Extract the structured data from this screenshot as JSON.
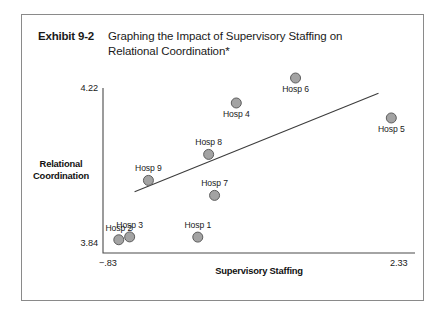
{
  "exhibit": {
    "number": "Exhibit 9-2",
    "title": "Graphing the Impact of Supervisory Staffing on Relational Coordination*"
  },
  "chart_data": {
    "type": "scatter",
    "title": "Graphing the Impact of Supervisory Staffing on Relational Coordination*",
    "xlabel": "Supervisory Staffing",
    "ylabel": "Relational Coordination",
    "xlim": [
      -0.83,
      2.33
    ],
    "ylim": [
      3.84,
      4.22
    ],
    "xticks": [
      "−.83",
      "2.33"
    ],
    "yticks": [
      "4.22",
      "3.84"
    ],
    "grid": false,
    "legend": false,
    "points": [
      {
        "label": "Hosp 1",
        "x": 0.13,
        "y": 3.8766,
        "label_pos": "above"
      },
      {
        "label": "Hosp 2",
        "x": -0.67,
        "y": 3.8705,
        "label_pos": "above"
      },
      {
        "label": "Hosp 3",
        "x": -0.56,
        "y": 3.8771,
        "label_pos": "above"
      },
      {
        "label": "Hosp 4",
        "x": 0.52,
        "y": 4.1855,
        "label_pos": "below"
      },
      {
        "label": "Hosp 5",
        "x": 2.09,
        "y": 4.151,
        "label_pos": "below"
      },
      {
        "label": "Hosp 6",
        "x": 1.12,
        "y": 4.243,
        "label_pos": "below"
      },
      {
        "label": "Hosp 7",
        "x": 0.3,
        "y": 3.9727,
        "label_pos": "above"
      },
      {
        "label": "Hosp 8",
        "x": 0.24,
        "y": 4.0671,
        "label_pos": "above"
      },
      {
        "label": "Hosp 9",
        "x": -0.37,
        "y": 4.0072,
        "label_pos": "above"
      }
    ],
    "trendline": {
      "x0": -0.51,
      "y0": 3.9812,
      "x1": 1.96,
      "y1": 4.2081
    }
  }
}
